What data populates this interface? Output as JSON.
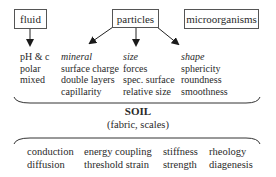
{
  "top_boxes": {
    "fluid": "fluid",
    "particles": "particles",
    "microorganisms": "microorganisms"
  },
  "columns": {
    "fluid": {
      "items": [
        "pH & c",
        "polar",
        "mixed"
      ]
    },
    "mineral": {
      "heading": "mineral",
      "items": [
        "surface charge",
        "double layers",
        "capillarity"
      ]
    },
    "size": {
      "heading": "size",
      "items": [
        "forces",
        "spec. surface",
        "relative size"
      ]
    },
    "shape": {
      "heading": "shape",
      "items": [
        "sphericity",
        "roundness",
        "smoothness"
      ]
    }
  },
  "soil": {
    "title": "SOIL",
    "subtitle": "(fabric, scales)"
  },
  "properties": [
    [
      "conduction",
      "diffusion"
    ],
    [
      "energy coupling",
      "threshold strain"
    ],
    [
      "stiffness",
      "strength"
    ],
    [
      "rheology",
      "diagenesis"
    ]
  ]
}
